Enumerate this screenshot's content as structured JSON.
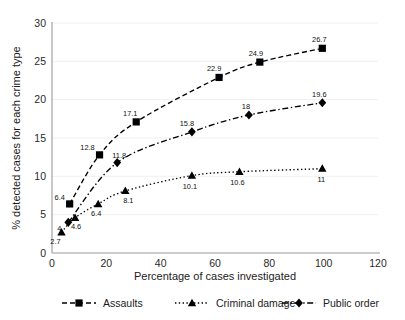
{
  "chart_data": {
    "type": "line",
    "title": "",
    "xlabel": "Percentage of cases investigated",
    "ylabel": "% detected cases for each crime type",
    "xlim": [
      0,
      120
    ],
    "ylim": [
      0,
      30
    ],
    "xticks": [
      "0",
      "20",
      "40",
      "60",
      "80",
      "100",
      "120"
    ],
    "yticks": [
      "0",
      "5",
      "10",
      "15",
      "20",
      "25",
      "30"
    ],
    "grid": "horizontal",
    "legend_position": "bottom",
    "series": [
      {
        "name": "Assaults",
        "marker": "square",
        "dash": "dashed",
        "color": "#000000",
        "points": [
          {
            "x": 6.5,
            "y": 6.4,
            "label": "6.4"
          },
          {
            "x": 17.5,
            "y": 12.8,
            "label": "12.8"
          },
          {
            "x": 31.0,
            "y": 17.1,
            "label": "17.1"
          },
          {
            "x": 61.5,
            "y": 22.9,
            "label": "22.9"
          },
          {
            "x": 76.5,
            "y": 24.9,
            "label": "24.9"
          },
          {
            "x": 99.5,
            "y": 26.7,
            "label": "26.7"
          }
        ]
      },
      {
        "name": "Criminal damage",
        "marker": "triangle",
        "dash": "dotted",
        "color": "#000000",
        "points": [
          {
            "x": 3.5,
            "y": 2.7,
            "label": "2.7"
          },
          {
            "x": 8.5,
            "y": 4.6,
            "label": "4.6"
          },
          {
            "x": 17.0,
            "y": 6.4,
            "label": "6.4"
          },
          {
            "x": 27.0,
            "y": 8.1,
            "label": "8.1"
          },
          {
            "x": 51.5,
            "y": 10.1,
            "label": "10.1"
          },
          {
            "x": 69.0,
            "y": 10.6,
            "label": "10.6"
          },
          {
            "x": 99.5,
            "y": 11.0,
            "label": "11"
          }
        ]
      },
      {
        "name": "Public order",
        "marker": "diamond",
        "dash": "dashdot",
        "color": "#000000",
        "points": [
          {
            "x": 6.0,
            "y": 4.0,
            "label": "4"
          },
          {
            "x": 24.0,
            "y": 11.8,
            "label": "11.8"
          },
          {
            "x": 51.5,
            "y": 15.8,
            "label": "15.8"
          },
          {
            "x": 72.5,
            "y": 18.0,
            "label": "18"
          },
          {
            "x": 99.5,
            "y": 19.6,
            "label": "19.6"
          }
        ]
      }
    ],
    "label_offsets": {
      "Assaults": [
        [
          -10,
          -4
        ],
        [
          -12,
          -5
        ],
        [
          -6,
          -6
        ],
        [
          -5,
          -6
        ],
        [
          -4,
          -6
        ],
        [
          -3,
          -6
        ]
      ],
      "Criminal damage": [
        [
          -6,
          12
        ],
        [
          1,
          11
        ],
        [
          -2,
          12
        ],
        [
          3,
          12
        ],
        [
          -2,
          13
        ],
        [
          -2,
          13
        ],
        [
          -1,
          13
        ]
      ],
      "Public order": [
        [
          -9,
          9
        ],
        [
          2,
          -5
        ],
        [
          -5,
          -6
        ],
        [
          -3,
          -6
        ],
        [
          -3,
          -6
        ]
      ]
    }
  },
  "legend": {
    "items": [
      {
        "label": "Assaults",
        "marker": "square",
        "dash": "dashed"
      },
      {
        "label": "Criminal damage",
        "marker": "triangle",
        "dash": "dotted"
      },
      {
        "label": "Public order",
        "marker": "diamond",
        "dash": "dashdot"
      }
    ]
  }
}
